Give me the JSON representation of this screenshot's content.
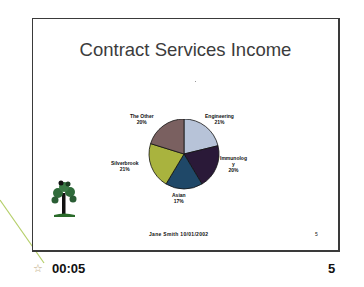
{
  "slide": {
    "title": "Contract Services Income",
    "footer_text": "Jane Smith   10/01/2002",
    "page_number": "5"
  },
  "status": {
    "timing": "00:05",
    "slide_number": "5",
    "transition_icon": "star-icon"
  },
  "chart_data": {
    "type": "pie",
    "title": "Contract Services Income",
    "slices": [
      {
        "label": "Engineering",
        "value": 21,
        "color": "#b7c3d8"
      },
      {
        "label": "Immunology",
        "value": 20,
        "color": "#2a1938"
      },
      {
        "label": "Asian",
        "value": 17,
        "color": "#1f4868"
      },
      {
        "label": "Silverbrook",
        "value": 21,
        "color": "#a9b33e"
      },
      {
        "label": "The Other",
        "value": 20,
        "color": "#7a6060"
      }
    ],
    "labels_display": {
      "engineering": [
        "Engineering",
        "21%"
      ],
      "immunology": [
        "Immunolog",
        "y",
        "20%"
      ],
      "asian": [
        "Asian",
        "17%"
      ],
      "silverbrook": [
        "Silverbrook",
        "21%"
      ],
      "other": [
        "The Other",
        "20%"
      ]
    }
  }
}
